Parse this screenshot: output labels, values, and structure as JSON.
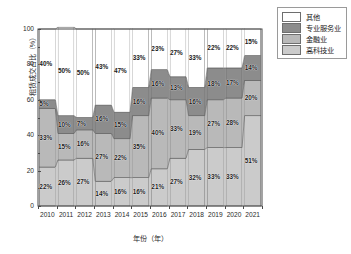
{
  "chart_data": {
    "type": "area",
    "title": "",
    "xlabel": "年份（年）",
    "ylabel": "租赁成交占比（%）",
    "ylim": [
      0,
      100
    ],
    "yticks": [
      0,
      20,
      40,
      60,
      80,
      100
    ],
    "ytick_labels": [
      "0",
      "20",
      "40",
      "60",
      "80",
      "100"
    ],
    "grid": false,
    "legend_position": "top-right",
    "stacked": true,
    "stack_order_bottom_to_top": [
      "高科技业",
      "金融业",
      "专业服务业",
      "其他"
    ],
    "categories": [
      "2010",
      "2011",
      "2012",
      "2013",
      "2014",
      "2015",
      "2016",
      "2017",
      "2018",
      "2019",
      "2020",
      "2021"
    ],
    "series": [
      {
        "name": "高科技业",
        "color": "#cbcbcb",
        "values": [
          22,
          26,
          27,
          14,
          16,
          16,
          21,
          27,
          32,
          33,
          33,
          51
        ],
        "labels": [
          "22%",
          "26%",
          "27%",
          "14%",
          "16%",
          "16%",
          "21%",
          "27%",
          "32%",
          "33%",
          "33%",
          "51%"
        ]
      },
      {
        "name": "金融业",
        "color": "#b9b9b9",
        "values": [
          33,
          15,
          16,
          27,
          22,
          35,
          40,
          33,
          19,
          27,
          28,
          20
        ],
        "labels": [
          "33%",
          "15%",
          "16%",
          "27%",
          "22%",
          "35%",
          "40%",
          "33%",
          "19%",
          "27%",
          "28%",
          "20%"
        ]
      },
      {
        "name": "专业服务业",
        "color": "#8c8c8c",
        "values": [
          5,
          10,
          7,
          16,
          15,
          16,
          16,
          13,
          16,
          18,
          17,
          14
        ],
        "labels": [
          "5%",
          "10%",
          "7%",
          "16%",
          "15%",
          "16%",
          "16%",
          "13%",
          "16%",
          "18%",
          "17%",
          "14%"
        ]
      },
      {
        "name": "其他",
        "color": "#ffffff",
        "values": [
          40,
          50,
          50,
          43,
          47,
          33,
          23,
          27,
          33,
          22,
          22,
          15
        ],
        "labels": [
          "40%",
          "50%",
          "50%",
          "43%",
          "47%",
          "33%",
          "23%",
          "27%",
          "33%",
          "22%",
          "22%",
          "15%"
        ]
      }
    ]
  },
  "legend": {
    "items": [
      {
        "label": "其他",
        "color": "#ffffff"
      },
      {
        "label": "专业服务业",
        "color": "#8c8c8c"
      },
      {
        "label": "金融业",
        "color": "#b9b9b9"
      },
      {
        "label": "高科技业",
        "color": "#cbcbcb"
      }
    ]
  },
  "axes": {
    "y_title": "租赁成交占比（%）",
    "x_title": "年份（年）"
  }
}
